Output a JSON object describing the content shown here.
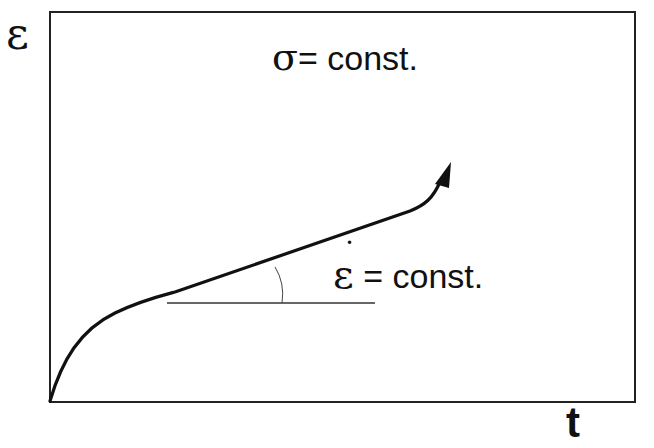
{
  "diagram": {
    "type": "creep-curve",
    "axes": {
      "y_label": "ε",
      "x_label": "t"
    },
    "annotations": {
      "stress": {
        "symbol": "σ",
        "text": "= const."
      },
      "strain_rate": {
        "symbol": "ε",
        "dot": "˙",
        "text": "= const."
      }
    },
    "colors": {
      "line": "#111111",
      "background": "#ffffff"
    }
  }
}
